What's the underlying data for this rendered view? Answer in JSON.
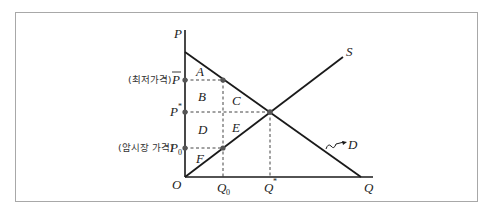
{
  "diagram": {
    "type": "supply-demand-price-floor",
    "axes": {
      "y_label": "P",
      "x_label": "Q",
      "origin_label": "O"
    },
    "curves": {
      "supply_label": "S",
      "demand_label": "D"
    },
    "y_ticks": {
      "price_floor": {
        "prefix": "(최저가격)",
        "symbol": "P",
        "overline": true
      },
      "equilibrium": {
        "symbol": "P",
        "superscript": "*"
      },
      "black_market": {
        "prefix": "(암시장 가격)",
        "symbol": "P",
        "subscript": "0"
      }
    },
    "x_ticks": {
      "q0": {
        "symbol": "Q",
        "subscript": "0"
      },
      "qstar": {
        "symbol": "Q",
        "superscript": "*"
      }
    },
    "regions": [
      "A",
      "B",
      "C",
      "D",
      "E",
      "F"
    ],
    "colors": {
      "line": "#1a1a1a",
      "dashed": "#444444",
      "dot": "#555555",
      "frame": "#a8a8a8"
    }
  }
}
